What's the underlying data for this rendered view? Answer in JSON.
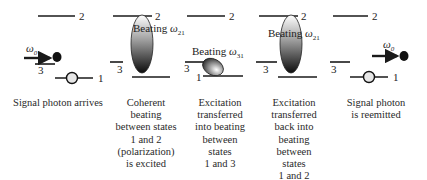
{
  "diagram": {
    "type": "energy-level-sequence",
    "level_labels": {
      "upper": "2",
      "middle": "3",
      "lower": "1"
    },
    "panels": [
      {
        "id": "arrival",
        "photon_label": "ω",
        "photon_label_sub": "0",
        "caption_lines": [
          "Signal photon arrives"
        ]
      },
      {
        "id": "coherent-beating-12",
        "beating_label": "Beating ",
        "beating_omega": "ω",
        "beating_sub": "21",
        "caption_lines": [
          "Coherent",
          "beating",
          "between states",
          "1 and 2",
          "(polarization)",
          "is excited"
        ]
      },
      {
        "id": "transfer-to-13",
        "beating_label": "Beating ",
        "beating_omega": "ω",
        "beating_sub": "31",
        "caption_lines": [
          "Excitation",
          "transferred",
          "into beating",
          "between",
          "states",
          "1 and 3"
        ]
      },
      {
        "id": "transfer-back-12",
        "beating_label": "Beating ",
        "beating_omega": "ω",
        "beating_sub": "21",
        "caption_lines": [
          "Excitation",
          "transferred",
          "back into",
          "beating",
          "between",
          "states",
          "1 and 2"
        ]
      },
      {
        "id": "reemission",
        "photon_label": "ω",
        "photon_label_sub": "0",
        "caption_lines": [
          "Signal photon",
          "is reemitted"
        ]
      }
    ]
  },
  "colors": {
    "line": "#1a1a1a",
    "text": "#222222",
    "gradient_light": "#ffffff",
    "gradient_dark": "#111111"
  }
}
